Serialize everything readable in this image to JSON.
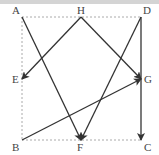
{
  "diagram": {
    "colors": {
      "line": "#333333",
      "dashed": "#aaaaaa",
      "label": "#444444",
      "topbar": "#d4d4d4"
    },
    "points": [
      {
        "id": "A",
        "label": "A",
        "x": 22,
        "y": 17,
        "lx": 12,
        "ly": 14
      },
      {
        "id": "H",
        "label": "H",
        "x": 81,
        "y": 17,
        "lx": 77,
        "ly": 14
      },
      {
        "id": "D",
        "label": "D",
        "x": 141,
        "y": 17,
        "lx": 143,
        "ly": 14
      },
      {
        "id": "E",
        "label": "E",
        "x": 22,
        "y": 79,
        "lx": 12,
        "ly": 83
      },
      {
        "id": "G",
        "label": "G",
        "x": 141,
        "y": 79,
        "lx": 144,
        "ly": 83
      },
      {
        "id": "B",
        "label": "B",
        "x": 22,
        "y": 140,
        "lx": 12,
        "ly": 151
      },
      {
        "id": "F",
        "label": "F",
        "x": 81,
        "y": 140,
        "lx": 77,
        "ly": 151
      },
      {
        "id": "C",
        "label": "C",
        "x": 141,
        "y": 140,
        "lx": 144,
        "ly": 151
      }
    ],
    "dashed_edges": [
      {
        "from": "A",
        "to": "D"
      },
      {
        "from": "A",
        "to": "B"
      },
      {
        "from": "B",
        "to": "C"
      }
    ],
    "arrows": [
      {
        "from": "A",
        "to": "F"
      },
      {
        "from": "H",
        "to": "E"
      },
      {
        "from": "H",
        "to": "G"
      },
      {
        "from": "D",
        "to": "F"
      },
      {
        "from": "B",
        "to": "G"
      },
      {
        "from": "D",
        "to": "C"
      }
    ]
  }
}
